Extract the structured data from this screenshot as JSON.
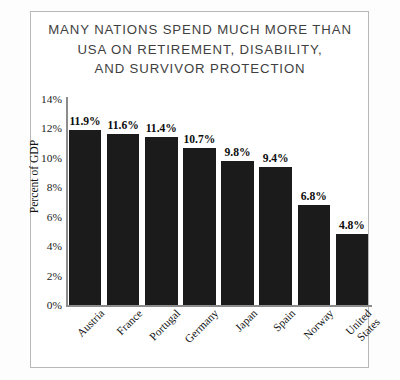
{
  "chart_data": {
    "type": "bar",
    "title": "MANY NATIONS SPEND MUCH MORE THAN\nUSA ON RETIREMENT, DISABILITY,\nAND SURVIVOR PROTECTION",
    "xlabel": "",
    "ylabel": "Percent of GDP",
    "categories": [
      "Austria",
      "France",
      "Portugal",
      "Germany",
      "Japan",
      "Spain",
      "Norway",
      "United\nStates"
    ],
    "values": [
      11.9,
      11.6,
      11.4,
      10.7,
      9.8,
      9.4,
      6.8,
      4.8
    ],
    "value_labels": [
      "11.9%",
      "11.6%",
      "11.4%",
      "10.7%",
      "9.8%",
      "9.4%",
      "6.8%",
      "4.8%"
    ],
    "ylim": [
      0,
      14
    ],
    "ytick_labels": [
      "14%",
      "12%",
      "10%",
      "8%",
      "6%",
      "4%",
      "2%",
      "0%"
    ],
    "ytick_values": [
      14,
      12,
      10,
      8,
      6,
      4,
      2,
      0
    ],
    "grid": false,
    "legend": false,
    "bar_color": "#1b1b1b",
    "axis_color": "#8c8c8c",
    "title_color": "#3f3f3f",
    "background": "#ffffff"
  }
}
